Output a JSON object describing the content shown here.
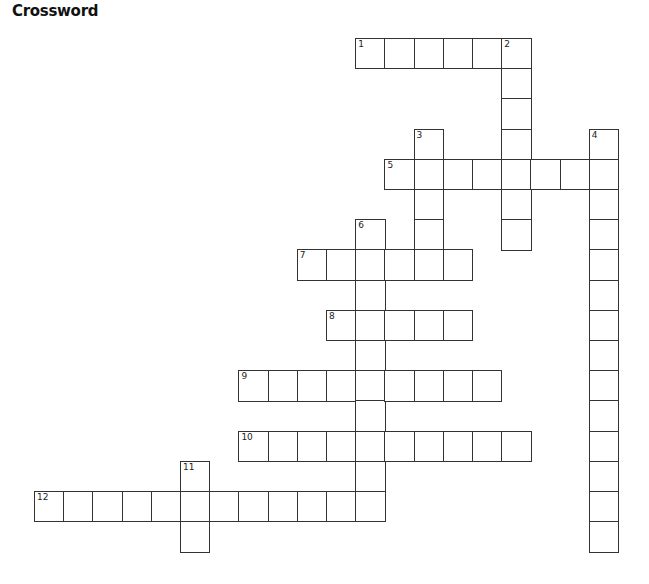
{
  "title": "Crossword",
  "grid": {
    "origin_x": 34,
    "origin_y": 38,
    "cell_w": 29.2,
    "cell_h": 30.2
  },
  "words": [
    {
      "number": 1,
      "direction": "across",
      "row": 0,
      "col": 11,
      "length": 6
    },
    {
      "number": 2,
      "direction": "down",
      "row": 0,
      "col": 16,
      "length": 7
    },
    {
      "number": 3,
      "direction": "down",
      "row": 3,
      "col": 13,
      "length": 5
    },
    {
      "number": 4,
      "direction": "down",
      "row": 3,
      "col": 19,
      "length": 14
    },
    {
      "number": 5,
      "direction": "across",
      "row": 4,
      "col": 12,
      "length": 8
    },
    {
      "number": 6,
      "direction": "down",
      "row": 6,
      "col": 11,
      "length": 10
    },
    {
      "number": 7,
      "direction": "across",
      "row": 7,
      "col": 9,
      "length": 6
    },
    {
      "number": 8,
      "direction": "across",
      "row": 9,
      "col": 10,
      "length": 5
    },
    {
      "number": 9,
      "direction": "across",
      "row": 11,
      "col": 7,
      "length": 9
    },
    {
      "number": 10,
      "direction": "across",
      "row": 13,
      "col": 7,
      "length": 10
    },
    {
      "number": 11,
      "direction": "down",
      "row": 14,
      "col": 5,
      "length": 3
    },
    {
      "number": 12,
      "direction": "across",
      "row": 15,
      "col": 0,
      "length": 12
    }
  ]
}
